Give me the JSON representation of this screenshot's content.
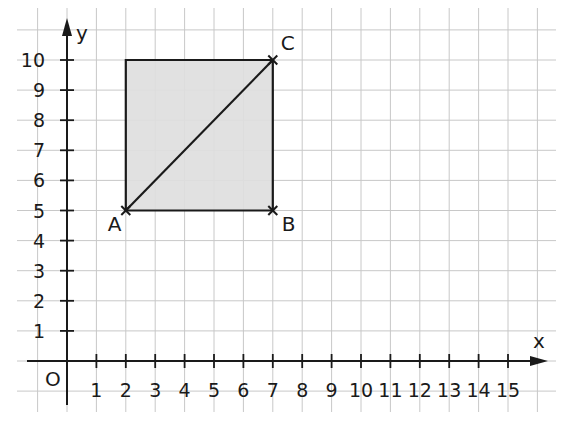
{
  "diagram": {
    "type": "coordinate-grid",
    "axes": {
      "x_label": "x",
      "y_label": "y",
      "origin_label": "O",
      "x_ticks": [
        "1",
        "2",
        "3",
        "4",
        "5",
        "6",
        "7",
        "8",
        "9",
        "10",
        "11",
        "12",
        "13",
        "14",
        "15"
      ],
      "y_ticks": [
        "1",
        "2",
        "3",
        "4",
        "5",
        "6",
        "7",
        "8",
        "9",
        "10"
      ]
    },
    "points": [
      {
        "label": "A",
        "x": 2,
        "y": 5
      },
      {
        "label": "B",
        "x": 7,
        "y": 5
      },
      {
        "label": "C",
        "x": 7,
        "y": 10
      }
    ],
    "shapes": {
      "square": {
        "corners": [
          [
            2,
            5
          ],
          [
            7,
            5
          ],
          [
            7,
            10
          ],
          [
            2,
            10
          ]
        ],
        "fill": "#dedede",
        "stroke": "#1a1a1a"
      },
      "diagonal": {
        "from": "A",
        "to": "C"
      }
    },
    "colors": {
      "grid": "#c8c8c8",
      "axis": "#1a1a1a",
      "fill": "#dedede"
    }
  }
}
